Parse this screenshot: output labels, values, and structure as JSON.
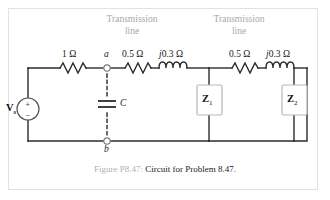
{
  "figure": {
    "caption_label": "Figure P8.47:",
    "caption_text": "Circuit for Problem 8.47."
  },
  "circuit": {
    "source": {
      "label": "V",
      "subscript": "s",
      "plus": "+",
      "minus": "−"
    },
    "nodes": {
      "a": "a",
      "b": "b"
    },
    "capacitor": {
      "label": "C"
    },
    "series_resistor": {
      "value": "1 Ω"
    },
    "transmission_lines": [
      {
        "title_line1": "Transmission",
        "title_line2": "line",
        "resistance": "0.5 Ω",
        "reactance_j": "j",
        "reactance_value": "0.3 Ω"
      },
      {
        "title_line1": "Transmission",
        "title_line2": "line",
        "resistance": "0.5 Ω",
        "reactance_j": "j",
        "reactance_value": "0.3 Ω"
      }
    ],
    "loads": [
      {
        "label": "Z",
        "subscript": "1"
      },
      {
        "label": "Z",
        "subscript": "2"
      }
    ]
  },
  "colors": {
    "wire": "#2b2b2b",
    "gray_text": "#a8a8a8",
    "frame": "#e2e2e2",
    "box_border": "#b8b8b8",
    "node_ring": "#808080"
  }
}
